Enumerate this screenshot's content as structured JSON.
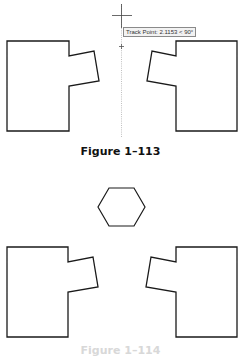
{
  "figures": [
    {
      "caption": "Figure 1–113",
      "tracking": {
        "tooltip_text": "Track Point: 2.1153 < 90°",
        "crosshair": {
          "x": 121,
          "y": 15
        },
        "track_marker": {
          "x": 121,
          "y": 46
        }
      },
      "shapes": [
        "left-notched-rectangle",
        "right-notched-rectangle"
      ]
    },
    {
      "caption": "Figure 1–114",
      "shapes": [
        "hexagon",
        "left-notched-rectangle",
        "right-notched-rectangle"
      ]
    }
  ],
  "colors": {
    "stroke": "#1a1a1a",
    "tracking_line": "#9a9a9a",
    "background": "#ffffff"
  }
}
